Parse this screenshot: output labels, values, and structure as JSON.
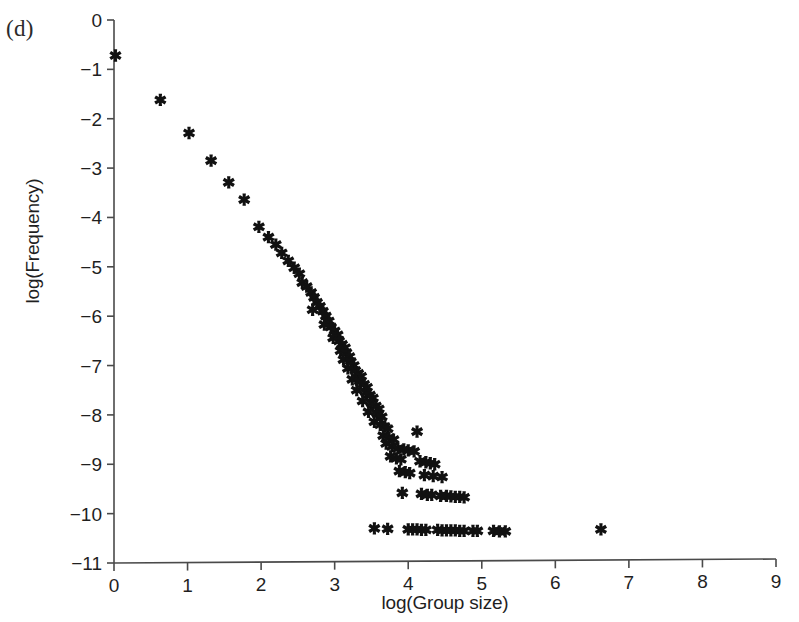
{
  "panel": {
    "label": "(d)"
  },
  "chart_data": {
    "type": "scatter",
    "title": "",
    "xlabel": "log(Group size)",
    "ylabel": "log(Frequency)",
    "xlim": [
      0,
      9
    ],
    "ylim": [
      -11,
      0
    ],
    "xticks": [
      0,
      1,
      2,
      3,
      4,
      5,
      6,
      7,
      8,
      9
    ],
    "xticklabels": [
      "0",
      "1",
      "2",
      "3",
      "4",
      "5",
      "6",
      "7",
      "8",
      "9"
    ],
    "yticks": [
      0,
      -1,
      -2,
      -3,
      -4,
      -5,
      -6,
      -7,
      -8,
      -9,
      -10,
      -11
    ],
    "yticklabels": [
      "0",
      "-1",
      "-2",
      "-3",
      "-4",
      "-5",
      "-6",
      "-7",
      "-8",
      "-9",
      "-10",
      "-11"
    ],
    "grid": false,
    "legend": null,
    "marker": {
      "shape": "asterisk-star",
      "color": "#111111",
      "size": 11
    },
    "series": [
      {
        "name": "group size distribution",
        "points": [
          [
            0.02,
            -0.7
          ],
          [
            0.63,
            -1.6
          ],
          [
            1.02,
            -2.27
          ],
          [
            1.32,
            -2.83
          ],
          [
            1.56,
            -3.27
          ],
          [
            1.77,
            -3.62
          ],
          [
            1.97,
            -4.17
          ],
          [
            2.1,
            -4.38
          ],
          [
            2.2,
            -4.53
          ],
          [
            2.28,
            -4.7
          ],
          [
            2.37,
            -4.86
          ],
          [
            2.45,
            -5.0
          ],
          [
            2.52,
            -5.12
          ],
          [
            2.56,
            -5.3
          ],
          [
            2.62,
            -5.38
          ],
          [
            2.68,
            -5.5
          ],
          [
            2.72,
            -5.6
          ],
          [
            2.76,
            -5.7
          ],
          [
            2.8,
            -5.78
          ],
          [
            2.7,
            -5.85
          ],
          [
            2.84,
            -5.88
          ],
          [
            2.88,
            -5.98
          ],
          [
            2.92,
            -6.08
          ],
          [
            2.86,
            -6.15
          ],
          [
            2.95,
            -6.2
          ],
          [
            3.0,
            -6.28
          ],
          [
            3.04,
            -6.36
          ],
          [
            2.98,
            -6.42
          ],
          [
            3.06,
            -6.48
          ],
          [
            3.1,
            -6.55
          ],
          [
            3.14,
            -6.62
          ],
          [
            3.08,
            -6.68
          ],
          [
            3.16,
            -6.72
          ],
          [
            3.2,
            -6.8
          ],
          [
            3.12,
            -6.86
          ],
          [
            3.22,
            -6.9
          ],
          [
            3.26,
            -6.98
          ],
          [
            3.18,
            -7.04
          ],
          [
            3.28,
            -7.08
          ],
          [
            3.32,
            -7.14
          ],
          [
            3.36,
            -7.2
          ],
          [
            3.24,
            -7.26
          ],
          [
            3.34,
            -7.3
          ],
          [
            3.4,
            -7.36
          ],
          [
            3.44,
            -7.42
          ],
          [
            3.3,
            -7.48
          ],
          [
            3.42,
            -7.52
          ],
          [
            3.48,
            -7.58
          ],
          [
            3.52,
            -7.64
          ],
          [
            3.38,
            -7.7
          ],
          [
            3.5,
            -7.74
          ],
          [
            3.56,
            -7.8
          ],
          [
            3.6,
            -7.86
          ],
          [
            3.46,
            -7.92
          ],
          [
            3.58,
            -7.96
          ],
          [
            3.64,
            -8.02
          ],
          [
            3.54,
            -8.12
          ],
          [
            3.62,
            -8.18
          ],
          [
            3.68,
            -8.22
          ],
          [
            3.72,
            -8.26
          ],
          [
            4.12,
            -8.32
          ],
          [
            3.66,
            -8.4
          ],
          [
            3.74,
            -8.44
          ],
          [
            3.8,
            -8.48
          ],
          [
            3.7,
            -8.56
          ],
          [
            3.78,
            -8.62
          ],
          [
            3.86,
            -8.66
          ],
          [
            3.94,
            -8.68
          ],
          [
            4.0,
            -8.7
          ],
          [
            4.08,
            -8.72
          ],
          [
            3.76,
            -8.82
          ],
          [
            3.84,
            -8.86
          ],
          [
            3.9,
            -8.88
          ],
          [
            4.16,
            -8.92
          ],
          [
            4.24,
            -8.94
          ],
          [
            4.3,
            -8.96
          ],
          [
            4.36,
            -8.98
          ],
          [
            3.88,
            -9.12
          ],
          [
            3.96,
            -9.14
          ],
          [
            4.02,
            -9.16
          ],
          [
            4.22,
            -9.2
          ],
          [
            4.34,
            -9.22
          ],
          [
            4.46,
            -9.24
          ],
          [
            3.92,
            -9.56
          ],
          [
            4.18,
            -9.58
          ],
          [
            4.26,
            -9.6
          ],
          [
            4.32,
            -9.6
          ],
          [
            4.44,
            -9.62
          ],
          [
            4.52,
            -9.62
          ],
          [
            4.58,
            -9.63
          ],
          [
            4.64,
            -9.64
          ],
          [
            4.7,
            -9.64
          ],
          [
            4.76,
            -9.65
          ],
          [
            3.54,
            -10.28
          ],
          [
            3.72,
            -10.29
          ],
          [
            4.0,
            -10.3
          ],
          [
            4.06,
            -10.3
          ],
          [
            4.12,
            -10.3
          ],
          [
            4.18,
            -10.31
          ],
          [
            4.24,
            -10.31
          ],
          [
            4.4,
            -10.31
          ],
          [
            4.46,
            -10.32
          ],
          [
            4.52,
            -10.32
          ],
          [
            4.58,
            -10.32
          ],
          [
            4.64,
            -10.32
          ],
          [
            4.7,
            -10.33
          ],
          [
            4.76,
            -10.33
          ],
          [
            4.88,
            -10.33
          ],
          [
            4.94,
            -10.33
          ],
          [
            5.16,
            -10.33
          ],
          [
            5.24,
            -10.34
          ],
          [
            5.32,
            -10.34
          ],
          [
            6.62,
            -10.3
          ]
        ]
      }
    ]
  }
}
